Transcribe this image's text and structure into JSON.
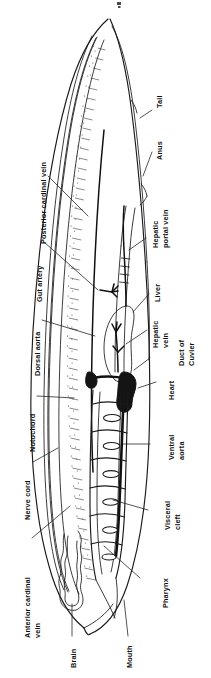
{
  "figure": {
    "organism": "Amphioxus (lancelet)",
    "orientation": "rotated 90 degrees counter-clockwise; anterior at bottom, posterior at top",
    "ink_color": "#1a1a1a",
    "background_color": "#ffffff"
  },
  "labels": [
    {
      "id": "tail",
      "text": "Tail"
    },
    {
      "id": "anus",
      "text": "Anus"
    },
    {
      "id": "hepatic-portal-vein",
      "text": "Hepatic",
      "text2": "portal vein"
    },
    {
      "id": "liver",
      "text": "Liver"
    },
    {
      "id": "hepatic-vein",
      "text": "Hepatic",
      "text2": "vein"
    },
    {
      "id": "duct-of-cuvier",
      "text": "Duct of",
      "text2": "Cuvier"
    },
    {
      "id": "heart",
      "text": "Heart"
    },
    {
      "id": "ventral-aorta",
      "text": "Ventral",
      "text2": "aorta"
    },
    {
      "id": "visceral-cleft",
      "text": "Visceral",
      "text2": "cleft"
    },
    {
      "id": "pharynx",
      "text": "Pharynx"
    },
    {
      "id": "mouth",
      "text": "Mouth"
    },
    {
      "id": "brain",
      "text": "Brain"
    },
    {
      "id": "anterior-cardinal-vein",
      "text": "Anterior  cardinal",
      "text2": "vein"
    },
    {
      "id": "nerve-cord",
      "text": "Nerve cord"
    },
    {
      "id": "notochord",
      "text": "Notochord"
    },
    {
      "id": "dorsal-aorta",
      "text": "Dorsal  aorta"
    },
    {
      "id": "gut-artery",
      "text": "Gut artery"
    },
    {
      "id": "posterior-cardinal-vein",
      "text": "Posterior cardinal vein"
    }
  ],
  "structures": [
    {
      "id": "body-outline",
      "name": "body-outline"
    },
    {
      "id": "notochord-band",
      "name": "notochord"
    },
    {
      "id": "nerve-cord-band",
      "name": "nerve-cord"
    },
    {
      "id": "brain-vesicle",
      "name": "brain"
    },
    {
      "id": "pharynx-chamber",
      "name": "pharynx"
    },
    {
      "id": "visceral-clefts",
      "name": "visceral-clefts",
      "count": 6
    },
    {
      "id": "heart-mass",
      "name": "heart"
    },
    {
      "id": "liver-sac",
      "name": "liver"
    },
    {
      "id": "gut-tube",
      "name": "gut"
    },
    {
      "id": "dorsal-aorta-line",
      "name": "dorsal-aorta"
    },
    {
      "id": "ventral-aorta-line",
      "name": "ventral-aorta"
    }
  ]
}
